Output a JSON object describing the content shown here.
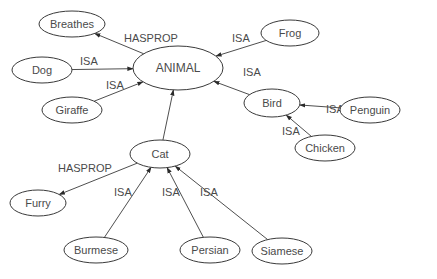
{
  "diagram": {
    "type": "semantic-network",
    "nodes": [
      {
        "id": "animal",
        "label": "ANIMAL"
      },
      {
        "id": "breathes",
        "label": "Breathes"
      },
      {
        "id": "dog",
        "label": "Dog"
      },
      {
        "id": "giraffe",
        "label": "Giraffe"
      },
      {
        "id": "frog",
        "label": "Frog"
      },
      {
        "id": "bird",
        "label": "Bird"
      },
      {
        "id": "penguin",
        "label": "Penguin"
      },
      {
        "id": "chicken",
        "label": "Chicken"
      },
      {
        "id": "cat",
        "label": "Cat"
      },
      {
        "id": "furry",
        "label": "Furry"
      },
      {
        "id": "burmese",
        "label": "Burmese"
      },
      {
        "id": "persian",
        "label": "Persian"
      },
      {
        "id": "siamese",
        "label": "Siamese"
      }
    ],
    "edges": [
      {
        "from": "animal",
        "to": "breathes",
        "label": "HASPROP"
      },
      {
        "from": "dog",
        "to": "animal",
        "label": "ISA"
      },
      {
        "from": "giraffe",
        "to": "animal",
        "label": "ISA"
      },
      {
        "from": "frog",
        "to": "animal",
        "label": "ISA"
      },
      {
        "from": "bird",
        "to": "animal",
        "label": "ISA"
      },
      {
        "from": "penguin",
        "to": "bird",
        "label": "ISA"
      },
      {
        "from": "chicken",
        "to": "bird",
        "label": "ISA"
      },
      {
        "from": "cat",
        "to": "animal",
        "label": ""
      },
      {
        "from": "cat",
        "to": "furry",
        "label": "HASPROP"
      },
      {
        "from": "burmese",
        "to": "cat",
        "label": "ISA"
      },
      {
        "from": "persian",
        "to": "cat",
        "label": "ISA"
      },
      {
        "from": "siamese",
        "to": "cat",
        "label": "ISA"
      }
    ]
  }
}
